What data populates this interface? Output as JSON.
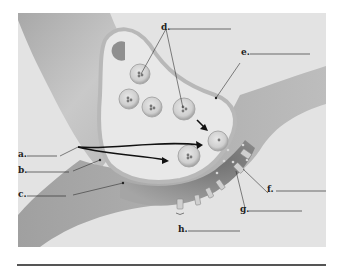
{
  "figure": {
    "background_color": "#e4e4e4",
    "tissue_color": "#c4c4c4",
    "cleft_color": "#8a8a8a",
    "labels": [
      {
        "id": "a",
        "text": "a."
      },
      {
        "id": "b",
        "text": "b."
      },
      {
        "id": "c",
        "text": "c."
      },
      {
        "id": "d",
        "text": "d."
      },
      {
        "id": "e",
        "text": "e."
      },
      {
        "id": "f",
        "text": "f."
      },
      {
        "id": "g",
        "text": "g."
      },
      {
        "id": "h",
        "text": "h."
      }
    ]
  }
}
